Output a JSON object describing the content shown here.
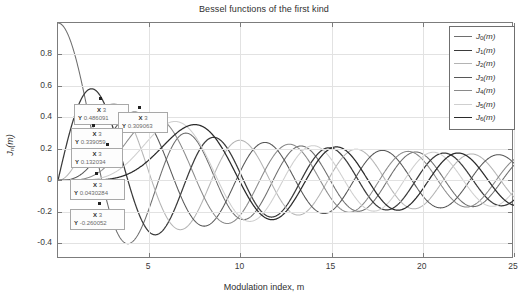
{
  "chart_data": {
    "type": "line",
    "title": "Bessel functions of the first kind",
    "xlabel": "Modulation index, m",
    "ylabel": "J_n(m)",
    "xlim": [
      0,
      25
    ],
    "ylim": [
      -0.5,
      1.0
    ],
    "grid": true,
    "legend_position": "top-right",
    "xticks": [
      5,
      10,
      15,
      20,
      25
    ],
    "yticks": [
      0.8,
      0.6,
      0.4,
      0.2,
      0,
      -0.2,
      -0.4
    ],
    "xtick_labels": [
      "5",
      "10",
      "15",
      "20",
      "25"
    ],
    "ytick_labels": [
      "0.8",
      "0.6",
      "0.4",
      "0.2",
      "0",
      "-0.2",
      "-0.4"
    ],
    "series": [
      {
        "name": "J0(m)",
        "order": 0,
        "color": "#6e6e6e"
      },
      {
        "name": "J1(m)",
        "order": 1,
        "color": "#3b3b3b"
      },
      {
        "name": "J2(m)",
        "order": 2,
        "color": "#b4b4b4"
      },
      {
        "name": "J3(m)",
        "order": 3,
        "color": "#575757"
      },
      {
        "name": "J4(m)",
        "order": 4,
        "color": "#8a8a8a"
      },
      {
        "name": "J5(m)",
        "order": 5,
        "color": "#cfcfcf"
      },
      {
        "name": "J6(m)",
        "order": 6,
        "color": "#2b2b2b"
      }
    ],
    "annotations": [
      {
        "label_x": "X",
        "value_x": "3",
        "label_y": "Y",
        "value_y": "0.486091",
        "series": "J2(m)"
      },
      {
        "label_x": "X",
        "value_x": "3",
        "label_y": "Y",
        "value_y": "0.309063",
        "series": "J3(m)"
      },
      {
        "label_x": "X",
        "value_x": "3",
        "label_y": "Y",
        "value_y": "0.339059",
        "series": "J1(m)"
      },
      {
        "label_x": "X",
        "value_x": "3",
        "label_y": "Y",
        "value_y": "0.132034",
        "series": "J4(m)"
      },
      {
        "label_x": "X",
        "value_x": "3",
        "label_y": "Y",
        "value_y": "0.0430284",
        "series": "J5(m)"
      },
      {
        "label_x": "X",
        "value_x": "3",
        "label_y": "Y",
        "value_y": "-0.260052",
        "series": "J0(m)"
      }
    ]
  },
  "legend": {
    "items": [
      {
        "base": "J",
        "sub": "0",
        "arg": "(m)"
      },
      {
        "base": "J",
        "sub": "1",
        "arg": "(m)"
      },
      {
        "base": "J",
        "sub": "2",
        "arg": "(m)"
      },
      {
        "base": "J",
        "sub": "3",
        "arg": "(m)"
      },
      {
        "base": "J",
        "sub": "4",
        "arg": "(m)"
      },
      {
        "base": "J",
        "sub": "5",
        "arg": "(m)"
      },
      {
        "base": "J",
        "sub": "6",
        "arg": "(m)"
      }
    ]
  },
  "axis_titles": {
    "x": "Modulation index, m",
    "y_base": "J",
    "y_sub": "n",
    "y_arg": "(m)"
  }
}
